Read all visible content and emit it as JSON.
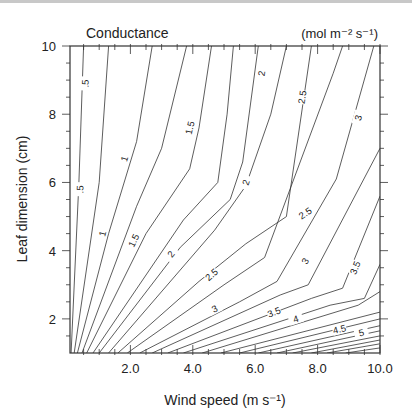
{
  "chart_data": {
    "type": "contour",
    "title": "Conductance",
    "units_label": "(mol m⁻² s⁻¹)",
    "xlabel": "Wind speed (m s⁻¹)",
    "ylabel": "Leaf dimension (cm)",
    "xlim": [
      0.05,
      10
    ],
    "ylim": [
      1,
      10
    ],
    "x_ticks": [
      2,
      4,
      6,
      8,
      10
    ],
    "x_tick_labels": [
      "2.0",
      "4.0",
      "6.0",
      "8.0",
      "10.0"
    ],
    "y_ticks": [
      2,
      4,
      6,
      8,
      10
    ],
    "y_tick_labels": [
      "2",
      "4",
      "6",
      "8",
      "10"
    ],
    "grid": false,
    "legend": null,
    "contour_levels": [
      0.5,
      1,
      1.5,
      2,
      2.5,
      3,
      3.5,
      4,
      4.5,
      5
    ],
    "contours": [
      {
        "level": 0.5,
        "label": ".5",
        "points": [
          [
            0.1,
            1
          ],
          [
            0.35,
            6
          ],
          [
            0.5,
            10
          ]
        ],
        "labels_at": [
          [
            0.38,
            5.8
          ],
          [
            0.55,
            8.9
          ]
        ]
      },
      {
        "level": 0.75,
        "label": "",
        "points": [
          [
            0.2,
            1
          ],
          [
            1.0,
            6
          ],
          [
            1.3,
            10
          ]
        ]
      },
      {
        "level": 1,
        "label": "1",
        "points": [
          [
            0.3,
            1
          ],
          [
            1.3,
            4.5
          ],
          [
            2.2,
            7.2
          ],
          [
            2.7,
            10
          ]
        ],
        "labels_at": [
          [
            1.1,
            4.5
          ],
          [
            1.8,
            6.7
          ]
        ]
      },
      {
        "level": 1.25,
        "label": "",
        "points": [
          [
            0.45,
            1
          ],
          [
            2.2,
            5.3
          ],
          [
            3.0,
            7.0
          ],
          [
            3.8,
            10
          ]
        ]
      },
      {
        "level": 1.5,
        "label": "1.5",
        "points": [
          [
            0.6,
            1
          ],
          [
            2.5,
            4.5
          ],
          [
            3.9,
            6.4
          ],
          [
            4.2,
            7.6
          ],
          [
            4.6,
            10
          ]
        ],
        "labels_at": [
          [
            2.1,
            4.3
          ],
          [
            3.9,
            7.6
          ]
        ]
      },
      {
        "level": 1.75,
        "label": "",
        "points": [
          [
            0.8,
            1
          ],
          [
            3.7,
            4.9
          ],
          [
            4.8,
            6.0
          ],
          [
            5.1,
            8.0
          ],
          [
            5.3,
            10
          ]
        ]
      },
      {
        "level": 2,
        "label": "2",
        "points": [
          [
            1.0,
            1
          ],
          [
            3.6,
            4.1
          ],
          [
            5.2,
            5.5
          ],
          [
            5.6,
            6.6
          ],
          [
            6.1,
            10
          ]
        ],
        "labels_at": [
          [
            3.3,
            3.9
          ],
          [
            5.7,
            6.0
          ],
          [
            6.2,
            9.2
          ]
        ]
      },
      {
        "level": 2.25,
        "label": "",
        "points": [
          [
            1.3,
            1
          ],
          [
            4.7,
            4.6
          ],
          [
            5.7,
            5.9
          ],
          [
            6.5,
            8.0
          ],
          [
            7.0,
            10
          ]
        ]
      },
      {
        "level": 2.5,
        "label": "2.5",
        "points": [
          [
            1.6,
            1
          ],
          [
            4.2,
            3.1
          ],
          [
            5.7,
            4.2
          ],
          [
            7.0,
            5.0
          ],
          [
            7.8,
            10
          ]
        ],
        "labels_at": [
          [
            4.6,
            3.3
          ],
          [
            7.6,
            5.1
          ],
          [
            7.5,
            8.5
          ]
        ]
      },
      {
        "level": 2.75,
        "label": "",
        "points": [
          [
            1.9,
            1
          ],
          [
            5.0,
            3.0
          ],
          [
            6.3,
            3.8
          ],
          [
            8.5,
            9.2
          ],
          [
            8.8,
            10
          ]
        ]
      },
      {
        "level": 3,
        "label": "3",
        "points": [
          [
            2.3,
            1
          ],
          [
            5.5,
            2.5
          ],
          [
            6.7,
            3.1
          ],
          [
            8.6,
            6.1
          ],
          [
            9.8,
            10
          ]
        ],
        "labels_at": [
          [
            4.7,
            2.3
          ],
          [
            7.6,
            3.7
          ],
          [
            9.3,
            7.9
          ]
        ]
      },
      {
        "level": 3.25,
        "label": "",
        "points": [
          [
            2.7,
            1
          ],
          [
            6.8,
            2.7
          ],
          [
            7.7,
            3.0
          ],
          [
            10,
            7.0
          ]
        ]
      },
      {
        "level": 3.5,
        "label": "3.5",
        "points": [
          [
            3.2,
            1
          ],
          [
            7.8,
            2.6
          ],
          [
            8.8,
            2.9
          ],
          [
            10,
            5.6
          ]
        ],
        "labels_at": [
          [
            6.6,
            2.2
          ],
          [
            9.2,
            3.5
          ]
        ]
      },
      {
        "level": 3.75,
        "label": "",
        "points": [
          [
            3.7,
            1
          ],
          [
            8.4,
            2.4
          ],
          [
            9.5,
            2.6
          ],
          [
            10,
            3.6
          ]
        ]
      },
      {
        "level": 4,
        "label": "4",
        "points": [
          [
            4.3,
            1
          ],
          [
            9.3,
            2.4
          ],
          [
            10,
            2.8
          ]
        ],
        "labels_at": [
          [
            7.3,
            2.0
          ]
        ]
      },
      {
        "level": 4.25,
        "label": "",
        "points": [
          [
            4.9,
            1
          ],
          [
            10,
            2.2
          ]
        ]
      },
      {
        "level": 4.5,
        "label": "4.5",
        "points": [
          [
            5.5,
            1
          ],
          [
            10,
            2.0
          ]
        ],
        "labels_at": [
          [
            8.7,
            1.7
          ]
        ]
      },
      {
        "level": 4.75,
        "label": "",
        "points": [
          [
            6.1,
            1
          ],
          [
            10,
            1.8
          ]
        ]
      },
      {
        "level": 5,
        "label": "5",
        "points": [
          [
            6.7,
            1
          ],
          [
            10,
            1.65
          ]
        ],
        "labels_at": [
          [
            9.4,
            1.6
          ]
        ]
      },
      {
        "level": 5.25,
        "label": "",
        "points": [
          [
            7.2,
            1
          ],
          [
            10,
            1.5
          ]
        ]
      },
      {
        "level": 5.5,
        "label": "",
        "points": [
          [
            7.8,
            1
          ],
          [
            10,
            1.38
          ]
        ]
      },
      {
        "level": 5.75,
        "label": "",
        "points": [
          [
            8.3,
            1
          ],
          [
            10,
            1.27
          ]
        ]
      },
      {
        "level": 6,
        "label": "",
        "points": [
          [
            8.9,
            1
          ],
          [
            10,
            1.15
          ]
        ]
      }
    ],
    "colors": {
      "line": "#333333",
      "axis": "#333333",
      "text": "#222222"
    }
  }
}
